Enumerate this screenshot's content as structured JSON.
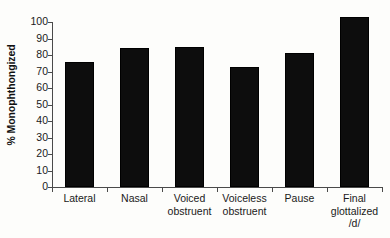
{
  "chart_data": {
    "type": "bar",
    "title": "",
    "xlabel": "",
    "ylabel": "% Monophthongized",
    "ylim": [
      0,
      100
    ],
    "grid": false,
    "legend": "none",
    "categories": [
      "Lateral",
      "Nasal",
      "Voiced obstruent",
      "Voiceless obstruent",
      "Pause",
      "Final glottalized /d/"
    ],
    "category_lines": [
      [
        "Lateral"
      ],
      [
        "Nasal"
      ],
      [
        "Voiced",
        "obstruent"
      ],
      [
        "Voiceless",
        "obstruent"
      ],
      [
        "Pause"
      ],
      [
        "Final",
        "glottalized",
        "/d/"
      ]
    ],
    "values": [
      76,
      84,
      85,
      73,
      81,
      103
    ],
    "ytick_labels": [
      "100",
      "90",
      "80",
      "70",
      "60",
      "50",
      "40",
      "30",
      "20",
      "10",
      "0"
    ],
    "ytick_values": [
      100,
      90,
      80,
      70,
      60,
      50,
      40,
      30,
      20,
      10,
      0
    ],
    "bar_color": "#0d0d0d",
    "axis_color": "#4a4a4a",
    "background_color": "#fdfdfb"
  }
}
